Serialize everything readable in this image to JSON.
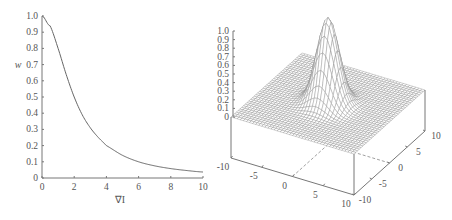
{
  "chart_data": [
    {
      "type": "line",
      "title": "",
      "xlabel": "∇I",
      "ylabel": "w",
      "xlim": [
        0,
        10
      ],
      "ylim": [
        0,
        1.0
      ],
      "xticks": [
        "0",
        "2",
        "4",
        "6",
        "8",
        "10"
      ],
      "yticks": [
        "0",
        "0.1",
        "0.2",
        "0.3",
        "0.4",
        "0.5",
        "0.6",
        "0.7",
        "0.8",
        "0.9",
        "1.0"
      ],
      "series": [
        {
          "name": "w(∇I)",
          "x": [
            0,
            0.5,
            1,
            1.5,
            2,
            2.5,
            3,
            3.5,
            4,
            5,
            6,
            7,
            8,
            9,
            10
          ],
          "y": [
            1.0,
            0.94,
            0.8,
            0.64,
            0.5,
            0.39,
            0.31,
            0.25,
            0.2,
            0.14,
            0.1,
            0.075,
            0.058,
            0.046,
            0.037
          ]
        }
      ],
      "grid": false,
      "legend": "none"
    },
    {
      "type": "surface",
      "title": "",
      "xlabel": "",
      "ylabel": "",
      "zlabel": "",
      "xlim": [
        -10,
        10
      ],
      "ylim": [
        -10,
        10
      ],
      "zlim": [
        0,
        1.0
      ],
      "xticks": [
        "-10",
        "-5",
        "0",
        "5",
        "10"
      ],
      "yticks": [
        "-10",
        "-5",
        "0",
        "5",
        "10"
      ],
      "zticks": [
        "0",
        "0.1",
        "0.2",
        "0.3",
        "0.4",
        "0.5",
        "0.6",
        "0.7",
        "0.8",
        "0.9",
        "1.0"
      ],
      "surface": {
        "description": "Gaussian-shaped peak of height 1.0 centred near (x=0, y=0), flat at 0 elsewhere; rendered as a wireframe mesh",
        "peak_height": 1.0,
        "peak_center": [
          0,
          0
        ],
        "sigma": 1.6
      },
      "grid": false,
      "legend": "none"
    }
  ]
}
